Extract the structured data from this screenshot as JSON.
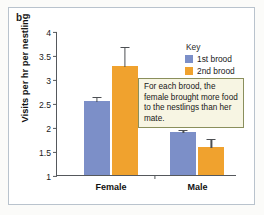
{
  "panel": {
    "label": "b"
  },
  "legend": {
    "title": "Key",
    "position": "top-right",
    "entries": [
      {
        "label": "1st brood",
        "color": "#7c8fc8"
      },
      {
        "label": "2nd brood",
        "color": "#f0a22e"
      }
    ]
  },
  "annotation": {
    "text": "For each brood, the female brought more food to the nestlings than her mate."
  },
  "chart_data": {
    "type": "bar",
    "title": "",
    "xlabel": "",
    "ylabel": "Visits per hr per nestling",
    "categories": [
      "Female",
      "Male"
    ],
    "ylim": [
      1,
      4
    ],
    "yticks": [
      "1",
      "1.5",
      "2",
      "2.5",
      "3",
      "3.5",
      "4"
    ],
    "ytick_values": [
      1,
      1.5,
      2,
      2.5,
      3,
      3.5,
      4
    ],
    "grid": false,
    "legend_position": "top-right",
    "series": [
      {
        "name": "1st brood",
        "color": "#7c8fc8",
        "values": [
          2.55,
          1.89
        ],
        "errors": [
          0.1,
          0.07
        ]
      },
      {
        "name": "2nd brood",
        "color": "#f0a22e",
        "values": [
          3.27,
          1.58
        ],
        "errors": [
          0.42,
          0.19
        ]
      }
    ]
  }
}
